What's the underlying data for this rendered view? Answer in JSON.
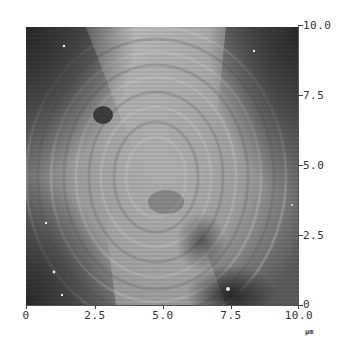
{
  "figure": {
    "type": "afm-topography-scan",
    "unit": "μm",
    "x_axis": {
      "ticks": [
        {
          "value": 0,
          "label": "0",
          "px": 26
        },
        {
          "value": 2.5,
          "label": "2.5",
          "px": 95
        },
        {
          "value": 5.0,
          "label": "5.0",
          "px": 163
        },
        {
          "value": 7.5,
          "label": "7.5",
          "px": 231
        },
        {
          "value": 10.0,
          "label": "10.0",
          "px": 299
        }
      ],
      "range": [
        0,
        10
      ]
    },
    "y_axis": {
      "position": "right",
      "ticks": [
        {
          "value": 10.0,
          "label": "10.0",
          "px": 25
        },
        {
          "value": 7.5,
          "label": "7.5",
          "px": 95
        },
        {
          "value": 5.0,
          "label": "5.0",
          "px": 165
        },
        {
          "value": 2.5,
          "label": "2.5",
          "px": 235
        },
        {
          "value": 0,
          "label": "0",
          "px": 305
        }
      ],
      "range": [
        0,
        10
      ]
    },
    "colors": {
      "dark": "#2e2e2e",
      "mid": "#7d7d7d",
      "light": "#bdbdbd",
      "axis": "#444444"
    }
  }
}
